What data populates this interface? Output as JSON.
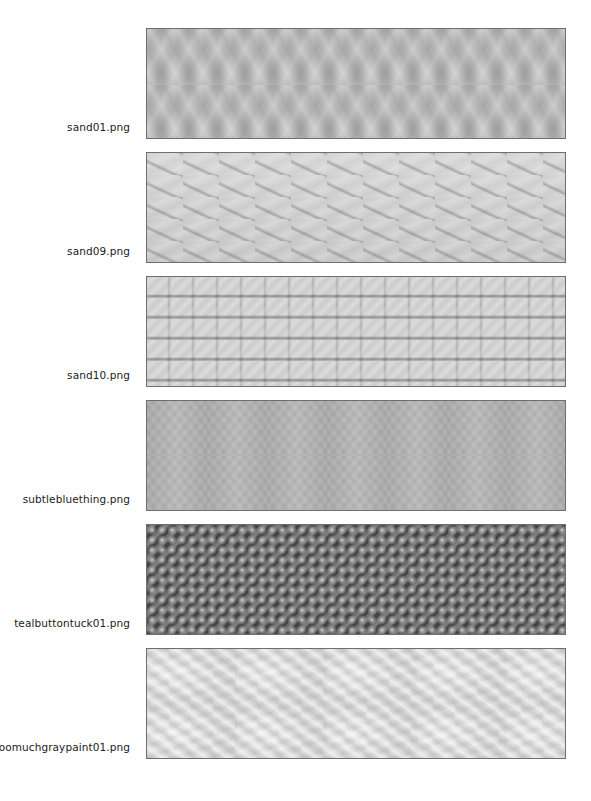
{
  "gallery": {
    "items": [
      {
        "label": "sand01.png",
        "texture": "sand01"
      },
      {
        "label": "sand09.png",
        "texture": "sand09"
      },
      {
        "label": "sand10.png",
        "texture": "sand10"
      },
      {
        "label": "subtlebluething.png",
        "texture": "subtlebluething"
      },
      {
        "label": "tealbuttontuck01.png",
        "texture": "tealbuttontuck01"
      },
      {
        "label": "toomuchgraypaint01.png",
        "texture": "toomuchgraypaint01"
      }
    ]
  },
  "colors": {
    "background": "#ffffff",
    "label_text": "#222222",
    "swatch_border": "#6e6e6e"
  }
}
